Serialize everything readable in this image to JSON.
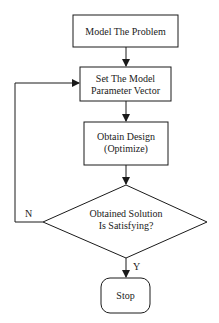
{
  "diagram": {
    "type": "flowchart",
    "nodes": {
      "model": {
        "shape": "rect",
        "lines": [
          "Model The Problem"
        ]
      },
      "setparam": {
        "shape": "rect",
        "lines": [
          "Set The Model",
          "Parameter Vector"
        ]
      },
      "obtain": {
        "shape": "rect",
        "lines": [
          "Obtain Design",
          "(Optimize)"
        ]
      },
      "decision": {
        "shape": "diamond",
        "lines": [
          "Obtained Solution",
          "Is Satisfying?"
        ]
      },
      "stop": {
        "shape": "terminal",
        "lines": [
          "Stop"
        ]
      }
    },
    "edges": [
      {
        "from": "model",
        "to": "setparam",
        "label": ""
      },
      {
        "from": "setparam",
        "to": "obtain",
        "label": ""
      },
      {
        "from": "obtain",
        "to": "decision",
        "label": ""
      },
      {
        "from": "decision",
        "to": "stop",
        "label": "Y"
      },
      {
        "from": "decision",
        "to": "setparam",
        "label": "N"
      }
    ],
    "labels": {
      "yes": "Y",
      "no": "N"
    },
    "colors": {
      "stroke": "#1a1a1a",
      "fill": "#ffffff"
    }
  }
}
